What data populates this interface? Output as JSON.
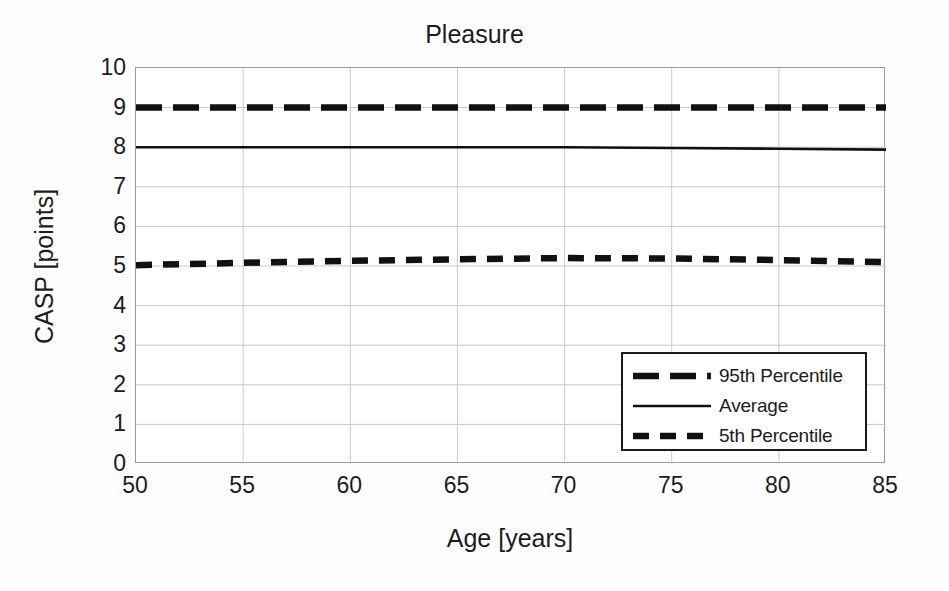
{
  "chart_data": {
    "type": "line",
    "title": "Pleasure",
    "xlabel": "Age [years]",
    "ylabel": "CASP [points]",
    "xlim": [
      50,
      85
    ],
    "ylim": [
      0,
      10
    ],
    "grid": true,
    "legend_position": "lower-right inside plot area",
    "xticks": [
      50,
      55,
      60,
      65,
      70,
      75,
      80,
      85
    ],
    "yticks": [
      0,
      1,
      2,
      3,
      4,
      5,
      6,
      7,
      8,
      9,
      10
    ],
    "x": [
      50,
      55,
      60,
      65,
      70,
      75,
      80,
      85
    ],
    "series": [
      {
        "name": "95th Percentile",
        "style": "dashed-long",
        "color": "#111111",
        "values": [
          9.0,
          9.0,
          9.0,
          9.0,
          9.0,
          9.0,
          9.0,
          9.0
        ]
      },
      {
        "name": "Average",
        "style": "solid",
        "color": "#111111",
        "values": [
          8.0,
          8.0,
          8.0,
          8.0,
          8.0,
          7.98,
          7.96,
          7.94
        ]
      },
      {
        "name": "5th Percentile",
        "style": "dashed-short",
        "color": "#111111",
        "values": [
          5.02,
          5.08,
          5.13,
          5.17,
          5.2,
          5.19,
          5.15,
          5.1
        ]
      }
    ]
  },
  "chart": {
    "title": "Pleasure",
    "y_axis_title": "CASP [points]",
    "x_axis_title": "Age [years]",
    "y_tick_labels": [
      "10",
      "9",
      "8",
      "7",
      "6",
      "5",
      "4",
      "3",
      "2",
      "1",
      "0"
    ],
    "x_tick_labels": [
      "50",
      "55",
      "60",
      "65",
      "70",
      "75",
      "80",
      "85"
    ],
    "legend": {
      "items": [
        {
          "label": "95th Percentile",
          "style": "dashed-long"
        },
        {
          "label": "Average",
          "style": "solid"
        },
        {
          "label": "5th Percentile",
          "style": "dashed-short"
        }
      ]
    },
    "colors": {
      "line": "#111111",
      "grid": "#c9c9c9",
      "axis_border": "#9a9a9a",
      "legend_border": "#1a1a1a",
      "background": "#ffffff",
      "text": "#1c1c1c"
    }
  }
}
